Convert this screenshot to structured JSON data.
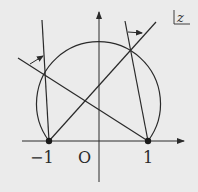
{
  "diagram": {
    "plane_label": "z",
    "axis_labels": {
      "minus_one": "−1",
      "origin": "O",
      "one": "1"
    },
    "colors": {
      "background": "#ebebeb",
      "ink": "#2a2a2a"
    },
    "points": [
      {
        "name": "minus-one",
        "value": -1
      },
      {
        "name": "one",
        "value": 1
      }
    ],
    "elements": [
      "real axis with arrow",
      "imaginary axis with arrow",
      "circular arc through -1 and 1 passing above the origin",
      "line from -1 through arc (right intersection)",
      "line from 1 through arc (left intersection)",
      "near-vertical line from -1 through left intersection",
      "near-vertical line from 1 through right intersection",
      "angle arrow at left intersection",
      "angle arrow at right intersection"
    ]
  }
}
